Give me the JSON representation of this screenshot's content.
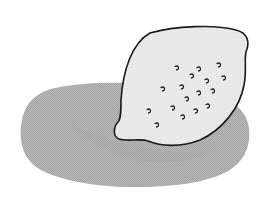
{
  "illustration": {
    "subject": "lemon",
    "description": "Black-and-white halftone illustration of a lemon resting on a large oval gray shadow",
    "colors": {
      "background": "#ffffff",
      "shadow": "#b3b3b3",
      "shadow_dark": "#a6a6a6",
      "lemon_fill": "#e8e8e8",
      "outline": "#1a1a1a",
      "dots": "#1a1a1a"
    },
    "dots": [
      {
        "x": 177,
        "y": 68
      },
      {
        "x": 199,
        "y": 69
      },
      {
        "x": 219,
        "y": 65
      },
      {
        "x": 192,
        "y": 76
      },
      {
        "x": 207,
        "y": 81
      },
      {
        "x": 224,
        "y": 78
      },
      {
        "x": 163,
        "y": 89
      },
      {
        "x": 182,
        "y": 87
      },
      {
        "x": 199,
        "y": 93
      },
      {
        "x": 213,
        "y": 91
      },
      {
        "x": 187,
        "y": 99
      },
      {
        "x": 173,
        "y": 108
      },
      {
        "x": 196,
        "y": 111
      },
      {
        "x": 208,
        "y": 106
      },
      {
        "x": 149,
        "y": 111
      },
      {
        "x": 183,
        "y": 117
      },
      {
        "x": 157,
        "y": 125
      }
    ]
  }
}
